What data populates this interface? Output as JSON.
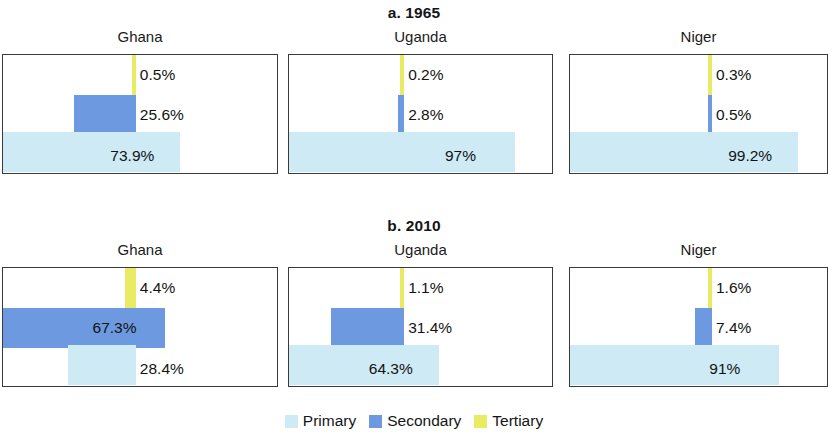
{
  "legend": {
    "items": [
      {
        "label": "Primary",
        "key": "primary",
        "color": "#cdeaf5"
      },
      {
        "label": "Secondary",
        "key": "secondary",
        "color": "#6c99e0"
      },
      {
        "label": "Tertiary",
        "key": "tertiary",
        "color": "#e9ec62"
      }
    ]
  },
  "sections": [
    {
      "title": "a. 1965",
      "panels": [
        {
          "country": "Ghana",
          "bars": [
            {
              "level": "Tertiary",
              "value": 0.5,
              "label": "0.5%"
            },
            {
              "level": "Secondary",
              "value": 25.6,
              "label": "25.6%"
            },
            {
              "level": "Primary",
              "value": 73.9,
              "label": "73.9%"
            }
          ]
        },
        {
          "country": "Uganda",
          "bars": [
            {
              "level": "Tertiary",
              "value": 0.2,
              "label": "0.2%"
            },
            {
              "level": "Secondary",
              "value": 2.8,
              "label": "2.8%"
            },
            {
              "level": "Primary",
              "value": 97.0,
              "label": "97%"
            }
          ]
        },
        {
          "country": "Niger",
          "bars": [
            {
              "level": "Tertiary",
              "value": 0.3,
              "label": "0.3%"
            },
            {
              "level": "Secondary",
              "value": 0.5,
              "label": "0.5%"
            },
            {
              "level": "Primary",
              "value": 99.2,
              "label": "99.2%"
            }
          ]
        }
      ]
    },
    {
      "title": "b. 2010",
      "panels": [
        {
          "country": "Ghana",
          "bars": [
            {
              "level": "Tertiary",
              "value": 4.4,
              "label": "4.4%"
            },
            {
              "level": "Secondary",
              "value": 67.3,
              "label": "67.3%"
            },
            {
              "level": "Primary",
              "value": 28.4,
              "label": "28.4%"
            }
          ]
        },
        {
          "country": "Uganda",
          "bars": [
            {
              "level": "Tertiary",
              "value": 1.1,
              "label": "1.1%"
            },
            {
              "level": "Secondary",
              "value": 31.4,
              "label": "31.4%"
            },
            {
              "level": "Primary",
              "value": 64.3,
              "label": "64.3%"
            }
          ]
        },
        {
          "country": "Niger",
          "bars": [
            {
              "level": "Tertiary",
              "value": 1.6,
              "label": "1.6%"
            },
            {
              "level": "Secondary",
              "value": 7.4,
              "label": "7.4%"
            },
            {
              "level": "Primary",
              "value": 91.0,
              "label": "91%"
            }
          ]
        }
      ]
    }
  ],
  "chart_data": {
    "type": "bar",
    "xlabel": "",
    "ylabel": "",
    "orientation": "horizontal",
    "xlim": [
      0,
      100
    ],
    "grid": false,
    "legend_position": "bottom-center",
    "legend_entries": [
      "Primary",
      "Secondary",
      "Tertiary"
    ],
    "series_colors": {
      "Primary": "#cdeaf5",
      "Secondary": "#6c99e0",
      "Tertiary": "#e9ec62"
    },
    "panels": [
      {
        "panel": "a. 1965",
        "country": "Ghana",
        "Tertiary": 0.5,
        "Secondary": 25.6,
        "Primary": 73.9
      },
      {
        "panel": "a. 1965",
        "country": "Uganda",
        "Tertiary": 0.2,
        "Secondary": 2.8,
        "Primary": 97.0
      },
      {
        "panel": "a. 1965",
        "country": "Niger",
        "Tertiary": 0.3,
        "Secondary": 0.5,
        "Primary": 99.2
      },
      {
        "panel": "b. 2010",
        "country": "Ghana",
        "Tertiary": 4.4,
        "Secondary": 67.3,
        "Primary": 28.4
      },
      {
        "panel": "b. 2010",
        "country": "Uganda",
        "Tertiary": 1.1,
        "Secondary": 31.4,
        "Primary": 64.3
      },
      {
        "panel": "b. 2010",
        "country": "Niger",
        "Tertiary": 1.6,
        "Secondary": 7.4,
        "Primary": 91.0
      }
    ]
  }
}
